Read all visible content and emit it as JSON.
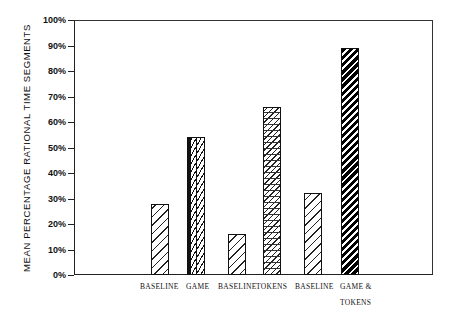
{
  "chart_data": {
    "type": "bar",
    "title": "",
    "xlabel": "",
    "ylabel": "MEAN PERCENTAGE RATIONAL TIME SEGMENTS",
    "ylim": [
      0,
      100
    ],
    "yticks": [
      "0%",
      "10%",
      "20%",
      "30%",
      "40%",
      "50%",
      "60%",
      "70%",
      "80%",
      "90%",
      "100%"
    ],
    "grid": false,
    "legend": null,
    "categories": [
      "BASELINE",
      "GAME",
      "BASELINE",
      "TOKENS",
      "BASELINE",
      "GAME & TOKENS"
    ],
    "values": [
      28,
      54,
      16,
      66,
      32,
      89
    ],
    "patterns": [
      "baseline",
      "game",
      "baseline",
      "tokens",
      "baseline",
      "gametokens"
    ]
  },
  "labels": {
    "ylabel": "MEAN PERCENTAGE RATIONAL TIME SEGMENTS",
    "ticks": [
      "0%",
      "10%",
      "20%",
      "30%",
      "40%",
      "50%",
      "60%",
      "70%",
      "80%",
      "90%",
      "100%"
    ],
    "x": [
      "BASELINE",
      "GAME",
      "BASELINE",
      "TOKENS",
      "BASELINE",
      "GAME &\nTOKENS"
    ]
  }
}
